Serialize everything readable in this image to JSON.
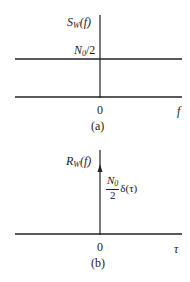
{
  "panel_a": {
    "y_label_main": "S",
    "y_label_sub": "W",
    "y_label_arg": "(f)",
    "level_label_main": "N",
    "level_label_sub": "0",
    "level_label_rest": "/2",
    "origin_label": "0",
    "x_label": "f",
    "caption": "(a)"
  },
  "panel_b": {
    "y_label_main": "R",
    "y_label_sub": "W",
    "y_label_arg": "(f)",
    "impulse_num_main": "N",
    "impulse_num_sub": "0",
    "impulse_den": "2",
    "impulse_rest": "δ(τ)",
    "origin_label": "0",
    "x_label": "τ",
    "caption": "(b)"
  },
  "colors": {
    "line": "#222222",
    "background": "#ffffff"
  }
}
